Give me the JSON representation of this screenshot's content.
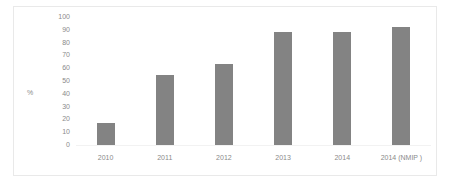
{
  "chart_data": {
    "type": "bar",
    "title": "",
    "subtitle": "",
    "xlabel": "",
    "ylabel": "%",
    "categories": [
      "2010",
      "2011",
      "2012",
      "2013",
      "2014",
      "2014 (NMIP )"
    ],
    "values": [
      17,
      55,
      63,
      88,
      88,
      92
    ],
    "ylim": [
      0,
      100
    ],
    "ytick_labels": [
      "100",
      "90",
      "80",
      "70",
      "60",
      "50",
      "40",
      "30",
      "20",
      "10",
      "0"
    ],
    "ytick_values": [
      100,
      90,
      80,
      70,
      60,
      50,
      40,
      30,
      20,
      10,
      0
    ],
    "grid": false,
    "legend": false,
    "legend_position": "none",
    "series": [
      {
        "name": "",
        "values": [
          17,
          55,
          63,
          88,
          88,
          92
        ]
      }
    ],
    "colors": {
      "bar": "#838383",
      "text": "#8a8a8a",
      "background": "#ffffff",
      "frame": "#e9e9e9"
    }
  }
}
